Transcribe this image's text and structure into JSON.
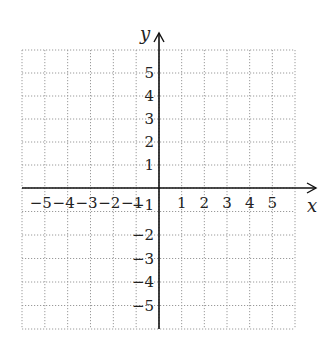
{
  "chart_data": {
    "type": "scatter",
    "title": "",
    "xlabel": "x",
    "ylabel": "y",
    "xlim": [
      -6,
      6
    ],
    "ylim": [
      -6,
      6
    ],
    "grid": true,
    "grid_style": "dotted",
    "x_ticks": [
      -5,
      -4,
      -3,
      -2,
      -1,
      1,
      2,
      3,
      4,
      5
    ],
    "y_ticks": [
      -5,
      -4,
      -3,
      -2,
      -1,
      1,
      2,
      3,
      4,
      5
    ],
    "x_tick_labels": [
      "−5",
      "−4",
      "−3",
      "−2",
      "−1",
      "1",
      "2",
      "3",
      "4",
      "5"
    ],
    "y_tick_labels": [
      "5",
      "4",
      "3",
      "2",
      "1",
      "−1",
      "−2",
      "−3",
      "−4",
      "−5"
    ],
    "series": []
  },
  "colors": {
    "axis": "#111111",
    "grid": "#9a9a9a",
    "text": "#222222"
  }
}
